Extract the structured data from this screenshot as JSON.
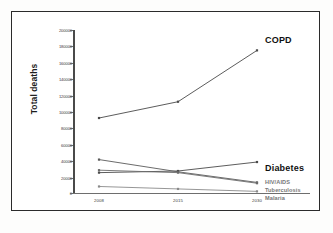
{
  "chart_data": {
    "type": "line",
    "title": "",
    "xlabel": "",
    "ylabel": "Total deaths",
    "x": [
      "2008",
      "2015",
      "2030"
    ],
    "categories": [
      "2008",
      "2015",
      "2030"
    ],
    "ylim": [
      0,
      200000
    ],
    "ytick_values": [
      0,
      20000,
      40000,
      60000,
      80000,
      100000,
      120000,
      140000,
      160000,
      180000,
      200000
    ],
    "ytick_labels": [
      "0",
      "20000",
      "40000",
      "60000",
      "80000",
      "100000",
      "120000",
      "140000",
      "160000",
      "180000",
      "200000"
    ],
    "grid": false,
    "legend_position": "inline-right-annotations",
    "series": [
      {
        "name": "COPD",
        "values": [
          92000,
          112000,
          175000
        ],
        "color": "#4a4a4a",
        "label_style": "bold"
      },
      {
        "name": "Diabetes",
        "values": [
          25000,
          27000,
          38000
        ],
        "color": "#4a4a4a",
        "label_style": "bold"
      },
      {
        "name": "HIV/AIDS",
        "values": [
          41000,
          26000,
          13000
        ],
        "color": "#5a5a5a",
        "label_style": "gray"
      },
      {
        "name": "Tuberculosis",
        "values": [
          28000,
          25000,
          12000
        ],
        "color": "#6a6a6a",
        "label_style": "gray"
      },
      {
        "name": "Malaria",
        "values": [
          8000,
          5000,
          2000
        ],
        "color": "#8a8a8a",
        "label_style": "gray"
      }
    ],
    "annotations": [
      {
        "text": "COPD",
        "series": "COPD"
      },
      {
        "text": "Diabetes",
        "series": "Diabetes"
      },
      {
        "text": "HIV/AIDS",
        "series": "HIV/AIDS"
      },
      {
        "text": "Tuberculosis",
        "series": "Tuberculosis"
      },
      {
        "text": "Malaria",
        "series": "Malaria"
      }
    ]
  },
  "axis": {
    "y_title": "Total deaths",
    "y_ticks": [
      "200000",
      "180000",
      "160000",
      "140000",
      "120000",
      "100000",
      "80000",
      "60000",
      "40000",
      "20000",
      "0"
    ],
    "x_ticks": [
      "2008",
      "2015",
      "2030"
    ]
  },
  "labels": {
    "copd": "COPD",
    "diabetes": "Diabetes",
    "hiv": "HIV/AIDS",
    "tb": "Tuberculosis",
    "malaria": "Malaria"
  },
  "colors": {
    "frame": "#2b2b2b",
    "axis": "#4a4a4a",
    "text": "#1c1c1c",
    "muted": "#777777",
    "background": "#ffffff"
  }
}
